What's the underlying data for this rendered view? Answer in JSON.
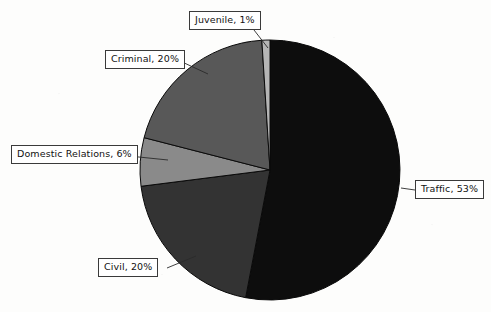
{
  "chart_data": {
    "type": "pie",
    "title": "",
    "subtitle": "",
    "xlabel": "",
    "ylabel": "",
    "legend_position": "none",
    "grid": false,
    "labels_show_percent": true,
    "start_angle_deg": 0,
    "direction": "clockwise",
    "categories": [
      "Traffic",
      "Civil",
      "Domestic Relations",
      "Criminal",
      "Juvenile"
    ],
    "values": [
      53,
      20,
      6,
      20,
      1
    ],
    "unit": "%",
    "slices": [
      {
        "name": "Traffic",
        "percent": 53,
        "label": "Traffic, 53%",
        "color": "#0d0d0d"
      },
      {
        "name": "Civil",
        "percent": 20,
        "label": "Civil, 20%",
        "color": "#333333"
      },
      {
        "name": "Domestic Relations",
        "percent": 6,
        "label": "Domestic Relations, 6%",
        "color": "#8a8a8a"
      },
      {
        "name": "Criminal",
        "percent": 20,
        "label": "Criminal, 20%",
        "color": "#585858"
      },
      {
        "name": "Juvenile",
        "percent": 1,
        "label": "Juvenile, 1%",
        "color": "#b5b5b5"
      }
    ],
    "annotations": [
      "Traffic, 53%",
      "Civil, 20%",
      "Domestic Relations, 6%",
      "Criminal, 20%",
      "Juvenile, 1%"
    ]
  },
  "callouts": {
    "juvenile": "Juvenile, 1%",
    "criminal": "Criminal, 20%",
    "domestic": "Domestic Relations, 6%",
    "civil": "Civil, 20%",
    "traffic": "Traffic, 53%"
  },
  "colors": {
    "traffic": "#0d0d0d",
    "civil": "#333333",
    "domestic": "#8a8a8a",
    "criminal": "#585858",
    "juvenile": "#b5b5b5",
    "slice_outline": "#0a0a0a",
    "callout_border": "#3a3a3a",
    "callout_background": "#ffffff",
    "page_background": "#fdfdfc"
  }
}
